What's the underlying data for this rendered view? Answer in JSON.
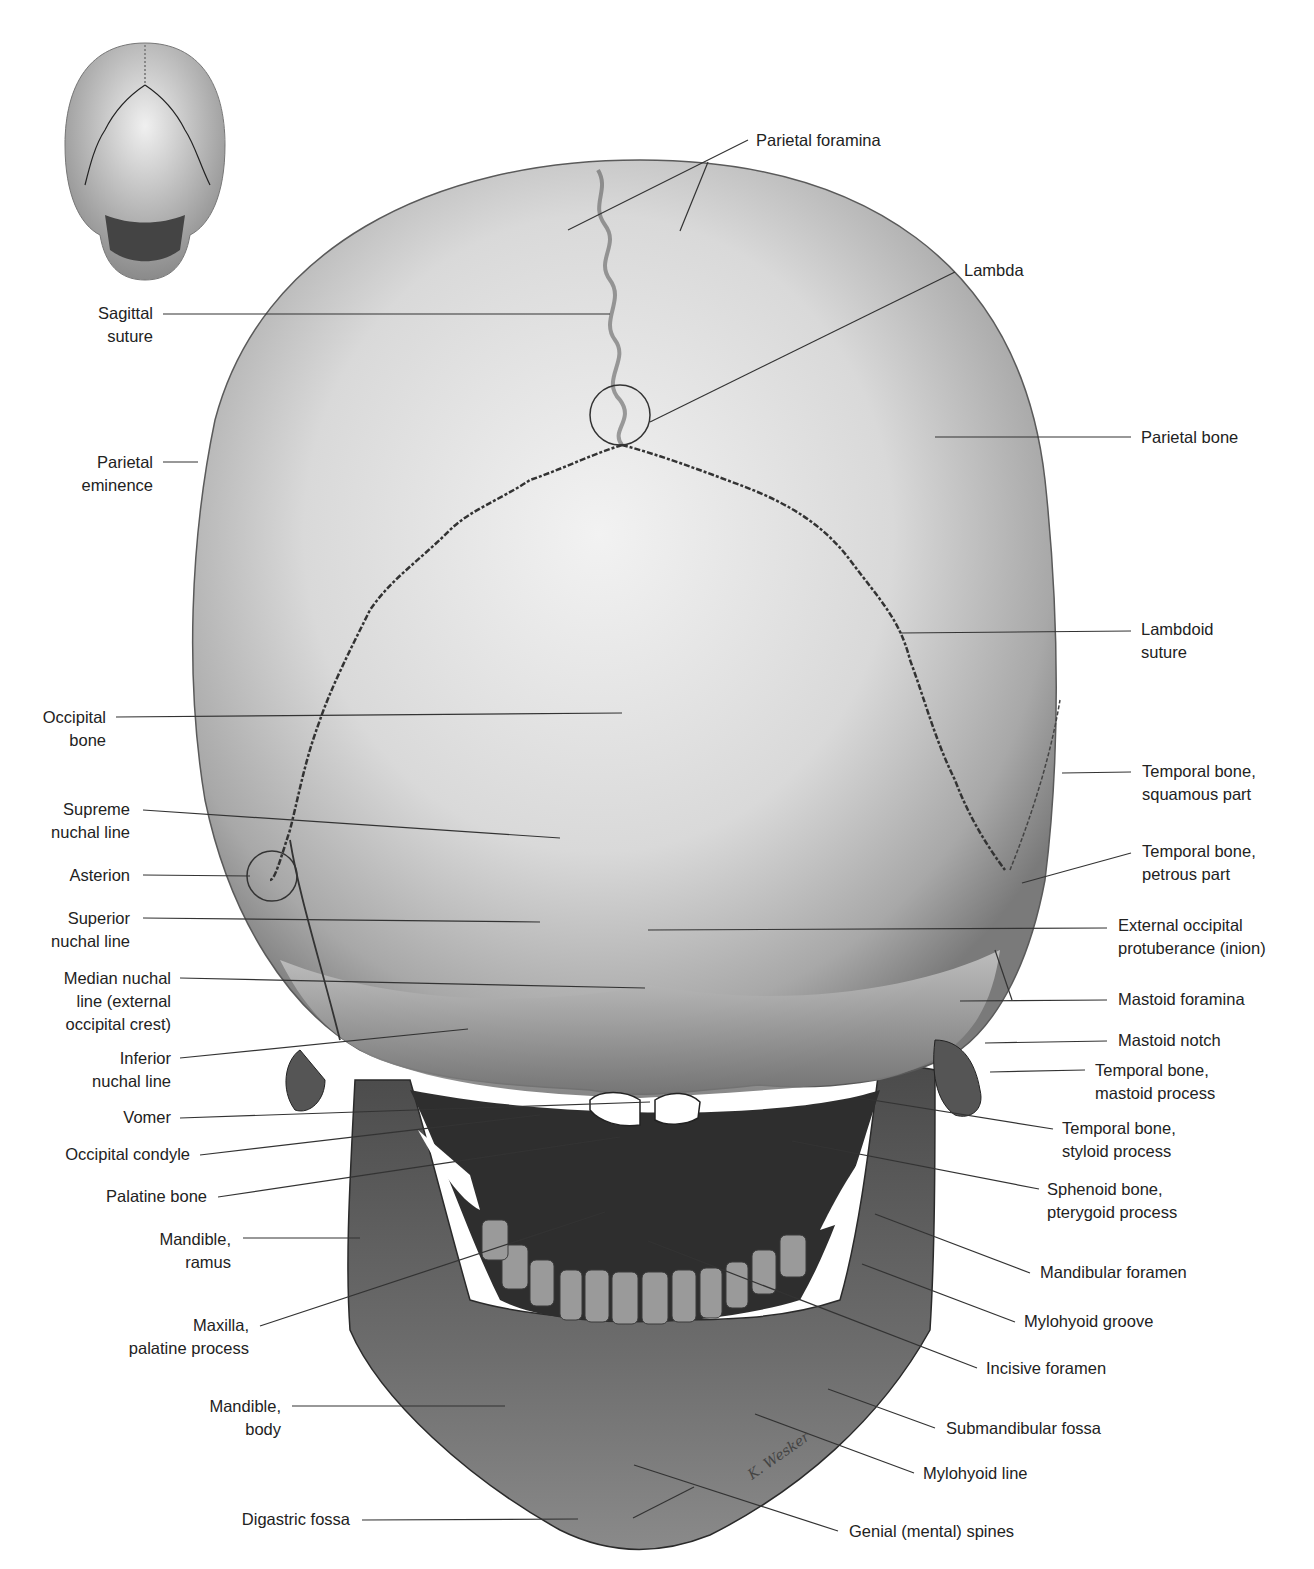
{
  "figure": {
    "view": "posterior",
    "colors": {
      "background": "#ffffff",
      "bone_light": "#e6e6e6",
      "bone_mid": "#a9a9a9",
      "bone_dark": "#3c3c3c",
      "text": "#222222",
      "leader_line": "#333333"
    }
  },
  "thumbnail": {
    "name": "orientation-thumbnail",
    "description": "Small posterior view of skull"
  },
  "labels_left": [
    {
      "id": "sagittal-suture",
      "lines": [
        "Sagittal",
        "suture"
      ]
    },
    {
      "id": "parietal-eminence",
      "lines": [
        "Parietal",
        "eminence"
      ]
    },
    {
      "id": "occipital-bone",
      "lines": [
        "Occipital",
        "bone"
      ]
    },
    {
      "id": "supreme-nuchal-line",
      "lines": [
        "Supreme",
        "nuchal line"
      ]
    },
    {
      "id": "asterion",
      "lines": [
        "Asterion"
      ]
    },
    {
      "id": "superior-nuchal-line",
      "lines": [
        "Superior",
        "nuchal line"
      ]
    },
    {
      "id": "median-nuchal-line",
      "lines": [
        "Median nuchal",
        "line (external",
        "occipital crest)"
      ]
    },
    {
      "id": "inferior-nuchal-line",
      "lines": [
        "Inferior",
        "nuchal line"
      ]
    },
    {
      "id": "vomer",
      "lines": [
        "Vomer"
      ]
    },
    {
      "id": "occipital-condyle",
      "lines": [
        "Occipital condyle"
      ]
    },
    {
      "id": "palatine-bone",
      "lines": [
        "Palatine bone"
      ]
    },
    {
      "id": "mandible-ramus",
      "lines": [
        "Mandible,",
        "ramus"
      ]
    },
    {
      "id": "maxilla-palatine-process",
      "lines": [
        "Maxilla,",
        "palatine process"
      ]
    },
    {
      "id": "mandible-body",
      "lines": [
        "Mandible,",
        "body"
      ]
    },
    {
      "id": "digastric-fossa",
      "lines": [
        "Digastric fossa"
      ]
    }
  ],
  "labels_right": [
    {
      "id": "parietal-foramina",
      "lines": [
        "Parietal foramina"
      ]
    },
    {
      "id": "lambda",
      "lines": [
        "Lambda"
      ]
    },
    {
      "id": "parietal-bone",
      "lines": [
        "Parietal bone"
      ]
    },
    {
      "id": "lambdoid-suture",
      "lines": [
        "Lambdoid",
        "suture"
      ]
    },
    {
      "id": "temporal-squamous",
      "lines": [
        "Temporal bone,",
        "squamous part"
      ]
    },
    {
      "id": "temporal-petrous",
      "lines": [
        "Temporal bone,",
        "petrous part"
      ]
    },
    {
      "id": "external-occipital-protuberance",
      "lines": [
        "External occipital",
        "protuberance (inion)"
      ]
    },
    {
      "id": "mastoid-foramina",
      "lines": [
        "Mastoid foramina"
      ]
    },
    {
      "id": "mastoid-notch",
      "lines": [
        "Mastoid notch"
      ]
    },
    {
      "id": "temporal-mastoid",
      "lines": [
        "Temporal bone,",
        "mastoid process"
      ]
    },
    {
      "id": "temporal-styloid",
      "lines": [
        "Temporal bone,",
        "styloid process"
      ]
    },
    {
      "id": "sphenoid-pterygoid",
      "lines": [
        "Sphenoid bone,",
        "pterygoid process"
      ]
    },
    {
      "id": "mandibular-foramen",
      "lines": [
        "Mandibular foramen"
      ]
    },
    {
      "id": "mylohyoid-groove",
      "lines": [
        "Mylohyoid groove"
      ]
    },
    {
      "id": "incisive-foramen",
      "lines": [
        "Incisive foramen"
      ]
    },
    {
      "id": "submandibular-fossa",
      "lines": [
        "Submandibular fossa"
      ]
    },
    {
      "id": "mylohyoid-line",
      "lines": [
        "Mylohyoid line"
      ]
    },
    {
      "id": "genial-spines",
      "lines": [
        "Genial (mental) spines"
      ]
    }
  ],
  "signature": "K. Wesker"
}
